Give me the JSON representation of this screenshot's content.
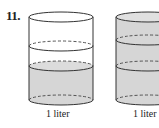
{
  "problem": {
    "number": "11."
  },
  "cylinders": [
    {
      "label": "1 liter",
      "fill_color": "#d6d6d6",
      "fill_fraction": "lower portion shaded"
    },
    {
      "label": "1 liter",
      "fill_color": "#d6d6d6",
      "fill_fraction": "fully shaded"
    }
  ],
  "colors": {
    "stroke": "#333333",
    "fill": "#d6d6d6",
    "background": "#ffffff"
  }
}
